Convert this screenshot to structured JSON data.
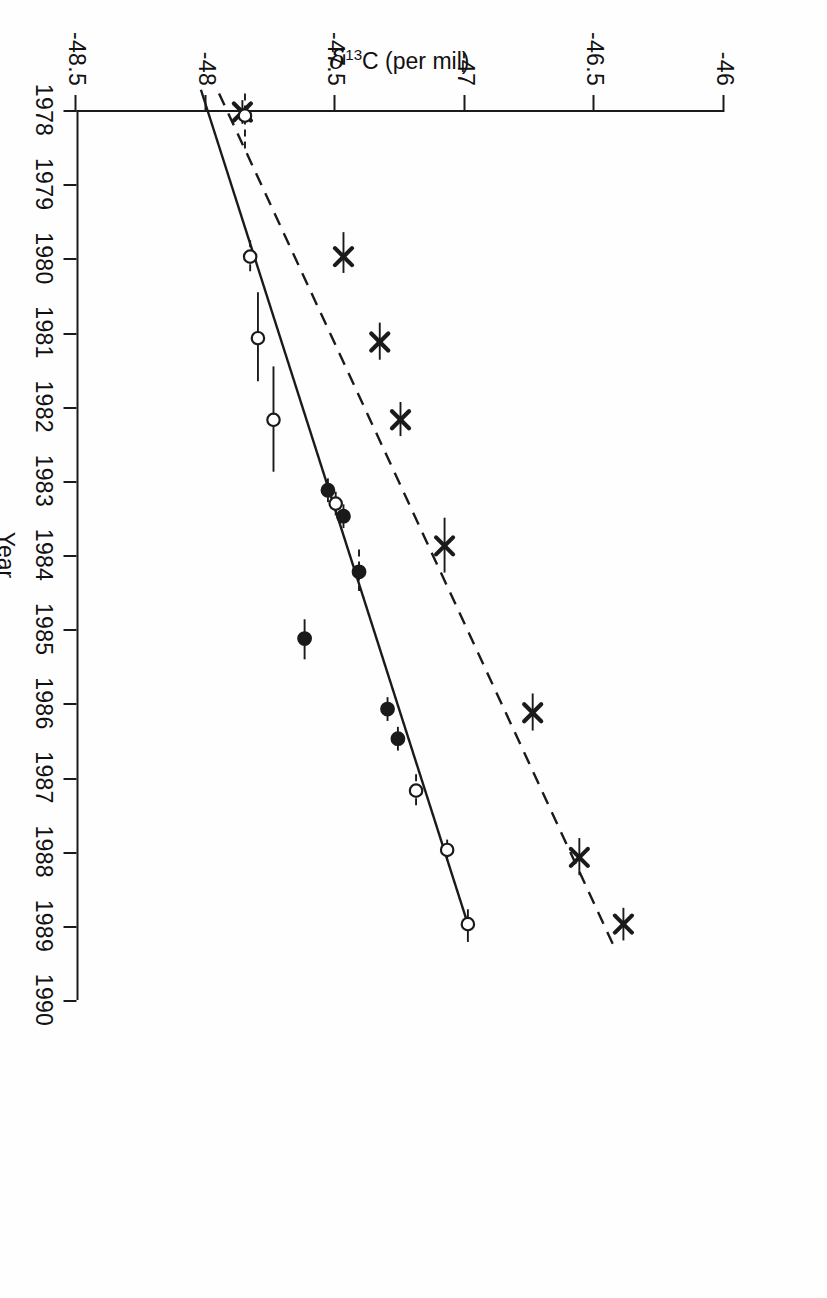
{
  "figure": {
    "rotation_degrees": 90,
    "background": "#fefefe",
    "ink_color": "#1a1a1a"
  },
  "axis_titles": {
    "x": "Year",
    "y_delta": "δ",
    "y_sup": "13",
    "y_rest": "C (per mil)"
  },
  "chart_data": {
    "type": "scatter",
    "title": "",
    "subtitle": "",
    "xlabel": "Year",
    "ylabel": "δ13C (per mil)",
    "xlim": [
      1978,
      1990
    ],
    "ylim": [
      -48.5,
      -46.0
    ],
    "yticks": [
      -46,
      -46.5,
      -47,
      -47.5,
      -48,
      -48.5
    ],
    "ytick_labels": [
      "-46",
      "-46.5",
      "-47",
      "-47.5",
      "-48",
      "-48.5"
    ],
    "xticks": [
      1978,
      1979,
      1980,
      1981,
      1982,
      1983,
      1984,
      1985,
      1986,
      1987,
      1988,
      1989,
      1990
    ],
    "xtick_labels": [
      "1978",
      "1979",
      "1980",
      "1981",
      "1982",
      "1983",
      "1984",
      "1985",
      "1986",
      "1987",
      "1988",
      "1989",
      "1990"
    ],
    "grid": false,
    "legend": "none",
    "annotations": [],
    "series": [
      {
        "name": "x-marker-series",
        "marker": "x",
        "line_style": "dashed",
        "fit_line": {
          "x": [
            1977.75,
            1989.3
          ],
          "y": [
            -47.95,
            -46.42
          ]
        },
        "points": [
          {
            "x": 1978.0,
            "y": -47.86,
            "xerr_lo": 0.16,
            "xerr_hi": 0.16
          },
          {
            "x": 1979.95,
            "y": -47.47,
            "xerr_lo": 0.33,
            "xerr_hi": 0.22
          },
          {
            "x": 1981.1,
            "y": -47.33,
            "xerr_lo": 0.26,
            "xerr_hi": 0.24
          },
          {
            "x": 1982.15,
            "y": -47.25,
            "xerr_lo": 0.24,
            "xerr_hi": 0.22
          },
          {
            "x": 1983.85,
            "y": -47.08,
            "xerr_lo": 0.38,
            "xerr_hi": 0.36
          },
          {
            "x": 1986.1,
            "y": -46.74,
            "xerr_lo": 0.26,
            "xerr_hi": 0.24
          },
          {
            "x": 1988.05,
            "y": -46.56,
            "xerr_lo": 0.26,
            "xerr_hi": 0.24
          },
          {
            "x": 1988.95,
            "y": -46.39,
            "xerr_lo": 0.22,
            "xerr_hi": 0.22
          }
        ]
      },
      {
        "name": "circle-marker-series",
        "marker": "circle",
        "line_style": "solid",
        "fit_line": {
          "x": [
            1977.7,
            1988.95
          ],
          "y": [
            -48.02,
            -46.99
          ]
        },
        "points": [
          {
            "x": 1978.05,
            "y": -47.85,
            "xerr_lo": 0.3,
            "xerr_hi": 0.45,
            "filled": false,
            "err_dashed": true
          },
          {
            "x": 1979.95,
            "y": -47.83,
            "xerr_lo": 0.22,
            "xerr_hi": 0.22,
            "filled": false,
            "err_dashed": true
          },
          {
            "x": 1981.05,
            "y": -47.8,
            "xerr_lo": 0.62,
            "xerr_hi": 0.58,
            "filled": false,
            "err_dashed": false
          },
          {
            "x": 1982.15,
            "y": -47.74,
            "xerr_lo": 0.72,
            "xerr_hi": 0.7,
            "filled": false,
            "err_dashed": false
          },
          {
            "x": 1983.1,
            "y": -47.53,
            "xerr_lo": 0.16,
            "xerr_hi": 0.16,
            "filled": true,
            "err_dashed": false
          },
          {
            "x": 1983.28,
            "y": -47.5,
            "xerr_lo": 0.16,
            "xerr_hi": 0.16,
            "filled": false,
            "err_dashed": false
          },
          {
            "x": 1983.45,
            "y": -47.47,
            "xerr_lo": 0.16,
            "xerr_hi": 0.16,
            "filled": true,
            "err_dashed": false
          },
          {
            "x": 1984.2,
            "y": -47.41,
            "xerr_lo": 0.3,
            "xerr_hi": 0.26,
            "filled": true,
            "err_dashed": true
          },
          {
            "x": 1985.1,
            "y": -47.62,
            "xerr_lo": 0.26,
            "xerr_hi": 0.28,
            "filled": true,
            "err_dashed": false
          },
          {
            "x": 1986.05,
            "y": -47.3,
            "xerr_lo": 0.16,
            "xerr_hi": 0.16,
            "filled": true,
            "err_dashed": false
          },
          {
            "x": 1986.45,
            "y": -47.26,
            "xerr_lo": 0.16,
            "xerr_hi": 0.16,
            "filled": true,
            "err_dashed": false
          },
          {
            "x": 1987.15,
            "y": -47.19,
            "xerr_lo": 0.22,
            "xerr_hi": 0.2,
            "filled": false,
            "err_dashed": true
          },
          {
            "x": 1987.95,
            "y": -47.07,
            "xerr_lo": 0.14,
            "xerr_hi": 0.14,
            "filled": false,
            "err_dashed": false
          },
          {
            "x": 1988.95,
            "y": -46.99,
            "xerr_lo": 0.2,
            "xerr_hi": 0.24,
            "filled": false,
            "err_dashed": false
          }
        ]
      }
    ]
  }
}
